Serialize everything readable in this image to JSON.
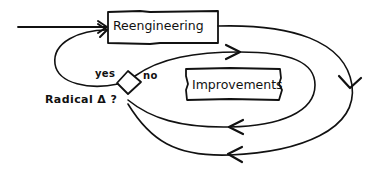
{
  "diagram": {
    "style": "hand-drawn flowchart",
    "stroke_color": "#111111",
    "background": "#ffffff",
    "nodes": [
      {
        "id": "reengineering",
        "shape": "rectangle",
        "label": "Reengineering"
      },
      {
        "id": "improvements",
        "shape": "rectangle",
        "label": "Improvements"
      },
      {
        "id": "decision",
        "shape": "diamond",
        "label": "Radical Δ ?"
      }
    ],
    "decision_labels": {
      "yes": "yes",
      "no": "no",
      "question": "Radical Δ ?"
    },
    "edges": [
      {
        "from": "input",
        "to": "reengineering",
        "label": ""
      },
      {
        "from": "reengineering",
        "to": "decision",
        "label": "",
        "route": "outer loop clockwise"
      },
      {
        "from": "decision",
        "to": "reengineering",
        "label": "yes"
      },
      {
        "from": "decision",
        "to": "decision",
        "label": "no",
        "route": "inner loop around Improvements"
      }
    ]
  }
}
